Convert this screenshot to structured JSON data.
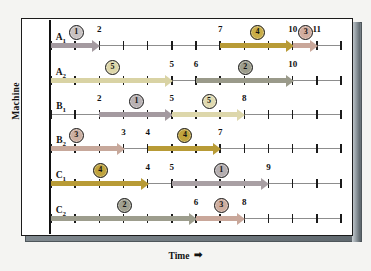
{
  "figure": {
    "y_axis_title": "Machine",
    "x_axis_title": "Time",
    "x_axis_arrow": "➡"
  },
  "chart_data": {
    "type": "bar",
    "title": "",
    "subtitle": "",
    "xlabel": "Time",
    "ylabel": "Machine",
    "xlim": [
      0,
      12
    ],
    "ylim": [
      0,
      6
    ],
    "grid": false,
    "legend": null,
    "tick_interval": 1,
    "categories": [
      "A1",
      "A2",
      "B1",
      "B2",
      "C1",
      "C2"
    ],
    "machines": [
      {
        "id": "A1",
        "label_main": "A",
        "label_sub": "1",
        "tasks": [
          {
            "job": "1",
            "start": 0,
            "end": 2,
            "color": "#a49aa0",
            "mark_color": "#c8c2c2",
            "mark_at": 1.0,
            "end_label": "2"
          },
          {
            "job": "4",
            "start": 7,
            "end": 10,
            "color": "#b89b36",
            "mark_color": "#c9ad47",
            "mark_at": 8.5,
            "end_label": "10",
            "start_label": "7"
          },
          {
            "job": "3",
            "start": 10,
            "end": 11,
            "color": "#c9a79a",
            "mark_color": "#d2ad9f",
            "mark_at": 10.5,
            "end_label": "11"
          }
        ]
      },
      {
        "id": "A2",
        "label_main": "A",
        "label_sub": "2",
        "tasks": [
          {
            "job": "5",
            "start": 0,
            "end": 5,
            "color": "#d9d3a4",
            "mark_color": "#ddd6a8",
            "mark_at": 2.5,
            "end_label": "5"
          },
          {
            "job": "2",
            "start": 6,
            "end": 10,
            "color": "#9a9a8a",
            "mark_color": "#9d9d8d",
            "mark_at": 8.0,
            "end_label": "10",
            "start_label": "6"
          }
        ]
      },
      {
        "id": "B1",
        "label_main": "B",
        "label_sub": "1",
        "tasks": [
          {
            "job": "1",
            "start": 2,
            "end": 5,
            "color": "#a49aa0",
            "mark_color": "#b9b2b4",
            "mark_at": 3.5,
            "end_label": "5",
            "start_label": "2"
          },
          {
            "job": "5",
            "start": 5,
            "end": 8,
            "color": "#ddd7ab",
            "mark_color": "#e0dab0",
            "mark_at": 6.5,
            "end_label": "8"
          }
        ]
      },
      {
        "id": "B2",
        "label_main": "B",
        "label_sub": "2",
        "tasks": [
          {
            "job": "3",
            "start": 0,
            "end": 3,
            "color": "#c7a89b",
            "mark_color": "#cdb0a2",
            "mark_at": 1.0,
            "end_label": "3"
          },
          {
            "job": "4",
            "start": 4,
            "end": 7,
            "color": "#b89b36",
            "mark_color": "#c0a33c",
            "mark_at": 5.5,
            "end_label": "7",
            "start_label": "4"
          }
        ]
      },
      {
        "id": "C1",
        "label_main": "C",
        "label_sub": "1",
        "tasks": [
          {
            "job": "4",
            "start": 0,
            "end": 4,
            "color": "#b89b36",
            "mark_color": "#c0a33c",
            "mark_at": 2.0,
            "end_label": "4"
          },
          {
            "job": "1",
            "start": 5,
            "end": 9,
            "color": "#a9a0a4",
            "mark_color": "#b6afb1",
            "mark_at": 7.0,
            "end_label": "9",
            "start_label": "5"
          }
        ]
      },
      {
        "id": "C2",
        "label_main": "C",
        "label_sub": "2",
        "tasks": [
          {
            "job": "2",
            "start": 0,
            "end": 6,
            "color": "#9d9d8d",
            "mark_color": "#a0a090",
            "mark_at": 3.0,
            "end_label": "6"
          },
          {
            "job": "3",
            "start": 6,
            "end": 8,
            "color": "#c9a79a",
            "mark_color": "#cfae9f",
            "mark_at": 7.0,
            "end_label": "8"
          }
        ]
      }
    ]
  }
}
